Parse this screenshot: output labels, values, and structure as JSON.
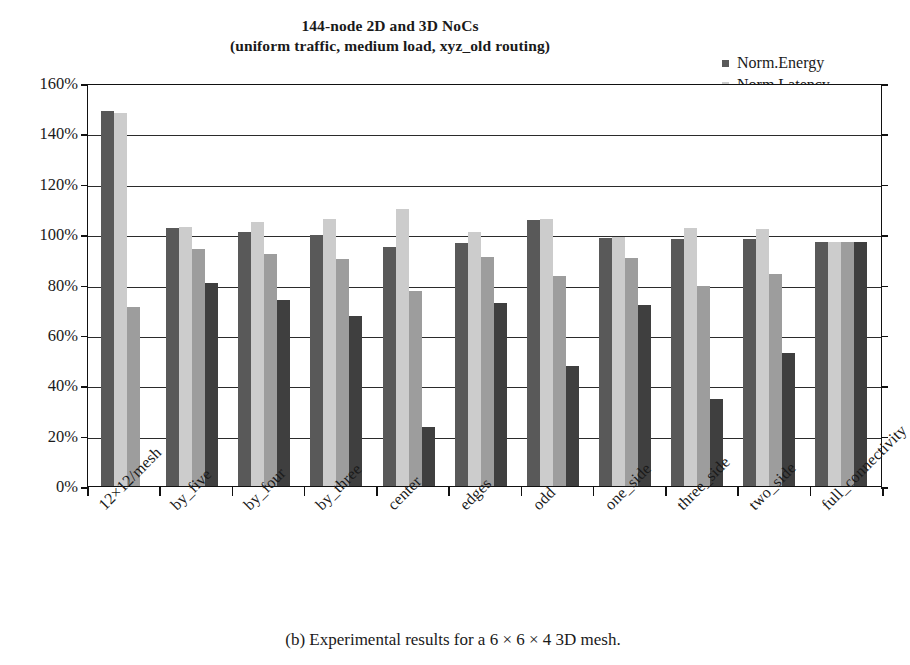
{
  "figure": {
    "caption": "(b) Experimental results for a 6 × 6 × 4 3D mesh."
  },
  "chart_data": {
    "type": "bar",
    "title": "144-node 2D and 3D NoCs",
    "subtitle": "(uniform traffic, medium load, xyz_old routing)",
    "title_line1": "144-node 2D and 3D NoCs",
    "title_line2": "(uniform traffic, medium load, xyz_old routing)",
    "xlabel": "",
    "ylabel": "",
    "ylim": [
      0,
      160
    ],
    "ytick_values": [
      0,
      20,
      40,
      60,
      80,
      100,
      120,
      140,
      160
    ],
    "ytick_labels": [
      "0%",
      "20%",
      "40%",
      "60%",
      "80%",
      "100%",
      "120%",
      "140%",
      "160%"
    ],
    "grid": true,
    "legend_position": "top-right",
    "categories": [
      "12×12/mesh",
      "by_five",
      "by_four",
      "by_three",
      "center",
      "edges",
      "odd",
      "one_side",
      "three_side",
      "two_side",
      "full_connectivity"
    ],
    "series": [
      {
        "name": "Norm.Energy",
        "color": "#595959",
        "values": [
          149,
          102.5,
          101,
          99.5,
          95,
          null,
          105.5,
          98.5,
          98,
          98,
          97
        ]
      },
      {
        "name": "Norm.Latency",
        "color": "#cccccc",
        "values": [
          148,
          103,
          105,
          106,
          110,
          101,
          106,
          99,
          102.5,
          102,
          97
        ]
      },
      {
        "name": "Norm.Area",
        "color": "#9d9d9d",
        "values": [
          71,
          94,
          92,
          90,
          77.5,
          91,
          83.5,
          90.5,
          79.5,
          84,
          97
        ]
      },
      {
        "name": "#Links",
        "color": "#3f3f3f",
        "values": [
          null,
          80.5,
          74,
          67.5,
          23.5,
          72.5,
          47.5,
          72,
          34.5,
          53,
          97
        ]
      }
    ],
    "extra_bars": {
      "note": "group 'edges' has a dark-gray Norm.Energy bar at 96.5",
      "edges_energy": 96.5
    }
  },
  "legend": {
    "items": [
      {
        "label": "Norm.Energy",
        "color": "#595959"
      },
      {
        "label": "Norm.Latency",
        "color": "#cccccc"
      },
      {
        "label": "Norm.Area",
        "color": "#9d9d9d"
      },
      {
        "label": "#Links",
        "color": "#3f3f3f"
      }
    ]
  }
}
